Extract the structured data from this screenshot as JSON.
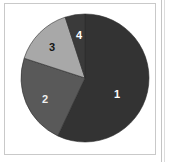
{
  "panel": {
    "name": "pie-chart-panel",
    "background": "#ffffff",
    "border_color": "#c9c9c9"
  },
  "chart_data": {
    "type": "pie",
    "title": "",
    "subtitle": "",
    "xlabel": "",
    "ylabel": "",
    "grid": false,
    "legend_position": "none",
    "labels_inside_slices": true,
    "start_angle_deg": 0,
    "direction": "clockwise",
    "center": {
      "x": 85,
      "y": 78
    },
    "radius": 64,
    "categories": [
      "1",
      "2",
      "3",
      "4"
    ],
    "values": [
      57,
      23,
      15,
      5
    ],
    "units": "percent",
    "slices": [
      {
        "label": "1",
        "value": 57,
        "color": "#333333",
        "label_color": "#ffffff",
        "start_deg": 0,
        "end_deg": 205.2,
        "label_x": 117,
        "label_y": 95
      },
      {
        "label": "2",
        "value": 23,
        "color": "#595959",
        "label_color": "#efefef",
        "start_deg": 205.2,
        "end_deg": 288.0,
        "label_x": 45,
        "label_y": 100
      },
      {
        "label": "3",
        "value": 15,
        "color": "#a8a8a8",
        "label_color": "#141414",
        "start_deg": 288.0,
        "end_deg": 342.0,
        "label_x": 52,
        "label_y": 48
      },
      {
        "label": "4",
        "value": 5,
        "color": "#3a3a3a",
        "label_color": "#ffffff",
        "start_deg": 342.0,
        "end_deg": 360.0,
        "label_x": 79,
        "label_y": 36
      }
    ]
  }
}
